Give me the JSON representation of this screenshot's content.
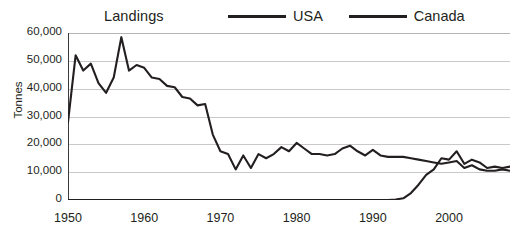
{
  "chart_data": {
    "type": "line",
    "title": "Landings",
    "xlabel": "",
    "ylabel": "Tonnes",
    "xlim": [
      1950,
      2008
    ],
    "ylim": [
      0,
      60000
    ],
    "grid": true,
    "legend_position": "top",
    "ytick_labels": [
      "60,000",
      "50,000",
      "40,000",
      "30,000",
      "20,000",
      "10,000",
      "0"
    ],
    "ytick_values": [
      60000,
      50000,
      40000,
      30000,
      20000,
      10000,
      0
    ],
    "xtick_labels": [
      "1950",
      "1960",
      "1970",
      "1980",
      "1990",
      "2000"
    ],
    "xtick_values": [
      1950,
      1960,
      1970,
      1980,
      1990,
      2000
    ],
    "x": [
      1950,
      1951,
      1952,
      1953,
      1954,
      1955,
      1956,
      1957,
      1958,
      1959,
      1960,
      1961,
      1962,
      1963,
      1964,
      1965,
      1966,
      1967,
      1968,
      1969,
      1970,
      1971,
      1972,
      1973,
      1974,
      1975,
      1976,
      1977,
      1978,
      1979,
      1980,
      1981,
      1982,
      1983,
      1984,
      1985,
      1986,
      1987,
      1988,
      1989,
      1990,
      1991,
      1992,
      1993,
      1994,
      1995,
      1996,
      1997,
      1998,
      1999,
      2000,
      2001,
      2002,
      2003,
      2004,
      2005,
      2006,
      2007,
      2008
    ],
    "series": [
      {
        "name": "USA",
        "color": "#231f20",
        "values": [
          28000,
          52000,
          46500,
          49000,
          42000,
          38500,
          44000,
          58500,
          46500,
          48500,
          47500,
          44000,
          43500,
          41000,
          40500,
          37000,
          36500,
          34000,
          34500,
          23500,
          17500,
          16500,
          11000,
          16000,
          11500,
          16500,
          15000,
          16500,
          19000,
          17500,
          20500,
          18500,
          16500,
          16500,
          16000,
          16500,
          18500,
          19500,
          17500,
          16000,
          18000,
          16000,
          15500,
          15500,
          15500,
          15000,
          14500,
          14000,
          13500,
          13000,
          13500,
          14000,
          11500,
          12500,
          11000,
          10500,
          10500,
          11000,
          10500
        ]
      },
      {
        "name": "Canada",
        "color": "#231f20",
        "values": [
          0,
          0,
          0,
          0,
          0,
          0,
          0,
          0,
          0,
          0,
          0,
          0,
          0,
          0,
          0,
          0,
          0,
          0,
          0,
          0,
          0,
          0,
          0,
          0,
          0,
          0,
          0,
          0,
          0,
          0,
          0,
          0,
          0,
          0,
          0,
          0,
          0,
          0,
          0,
          0,
          0,
          0,
          0,
          200,
          600,
          2500,
          5500,
          9000,
          11000,
          15000,
          14500,
          17500,
          13000,
          14500,
          13500,
          11500,
          12000,
          11500,
          12000
        ]
      }
    ]
  }
}
